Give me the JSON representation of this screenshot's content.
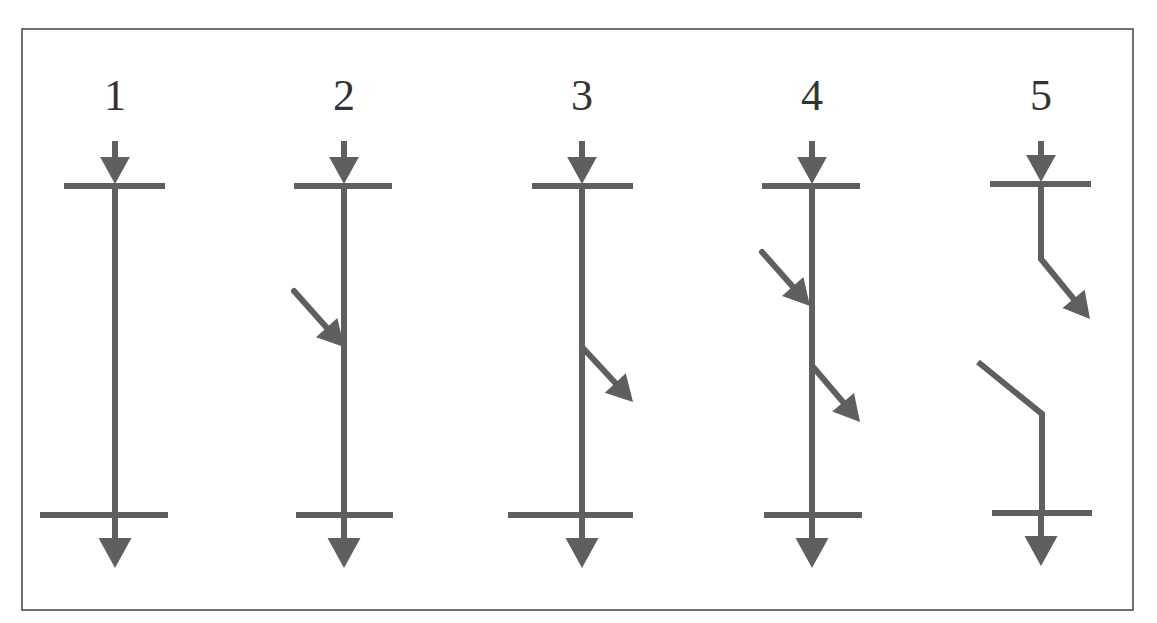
{
  "colors": {
    "line": "#5f5f5f",
    "frame": "#444444",
    "label": "#333333",
    "background": "#ffffff"
  },
  "frame": {
    "x": 22,
    "y": 29,
    "width": 1111,
    "height": 581
  },
  "cases": [
    {
      "label": "1",
      "x": 115,
      "top_bar_y": 186,
      "bottom_bar_y": 515,
      "top_bar": [
        64,
        165
      ],
      "bottom_bar": [
        40,
        168
      ],
      "segments": [
        [
          [
            115,
            186
          ],
          [
            115,
            515
          ]
        ]
      ],
      "arrows_in": [],
      "arrows_out": []
    },
    {
      "label": "2",
      "x": 344,
      "top_bar_y": 186,
      "bottom_bar_y": 515,
      "top_bar": [
        294,
        392
      ],
      "bottom_bar": [
        296,
        393
      ],
      "segments": [
        [
          [
            344,
            186
          ],
          [
            344,
            515
          ]
        ]
      ],
      "arrows_in": [
        [
          [
            294,
            291
          ],
          [
            344,
            347
          ]
        ]
      ],
      "arrows_out": []
    },
    {
      "label": "3",
      "x": 582,
      "top_bar_y": 186,
      "bottom_bar_y": 515,
      "top_bar": [
        532,
        633
      ],
      "bottom_bar": [
        508,
        633
      ],
      "segments": [
        [
          [
            582,
            186
          ],
          [
            582,
            515
          ]
        ]
      ],
      "arrows_in": [],
      "arrows_out": [
        [
          [
            582,
            347
          ],
          [
            633,
            402
          ]
        ]
      ]
    },
    {
      "label": "4",
      "x": 812,
      "top_bar_y": 186,
      "bottom_bar_y": 515,
      "top_bar": [
        762,
        860
      ],
      "bottom_bar": [
        764,
        862
      ],
      "segments": [
        [
          [
            812,
            186
          ],
          [
            812,
            515
          ]
        ]
      ],
      "arrows_in": [
        [
          [
            762,
            252
          ],
          [
            810,
            306
          ]
        ]
      ],
      "arrows_out": [
        [
          [
            814,
            368
          ],
          [
            860,
            422
          ]
        ]
      ]
    },
    {
      "label": "5",
      "x": 1041,
      "top_bar_y": 184,
      "bottom_bar_y": 513,
      "top_bar": [
        990,
        1091
      ],
      "bottom_bar": [
        992,
        1092
      ],
      "segments": [
        [
          [
            1041,
            184
          ],
          [
            1041,
            259
          ]
        ],
        [
          [
            978,
            362
          ],
          [
            1042,
            414
          ],
          [
            1042,
            513
          ]
        ]
      ],
      "arrows_in": [],
      "arrows_out": [
        [
          [
            1041,
            259
          ],
          [
            1090,
            319
          ]
        ]
      ]
    }
  ]
}
